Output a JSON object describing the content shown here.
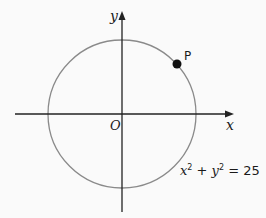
{
  "diagram": {
    "type": "coordinate-plane-circle",
    "colors": {
      "background": "#fafafa",
      "axis": "#222222",
      "circle": "#8a8a8a",
      "point": "#111111",
      "text": "#1a1a1a"
    },
    "axes": {
      "x_label": "x",
      "y_label": "y",
      "origin_label": "O"
    },
    "circle": {
      "equation": "x² + y² = 25",
      "center_px": [
        122,
        114
      ],
      "radius_px": 74
    },
    "point": {
      "label": "P",
      "position_px": [
        177,
        64
      ]
    }
  }
}
